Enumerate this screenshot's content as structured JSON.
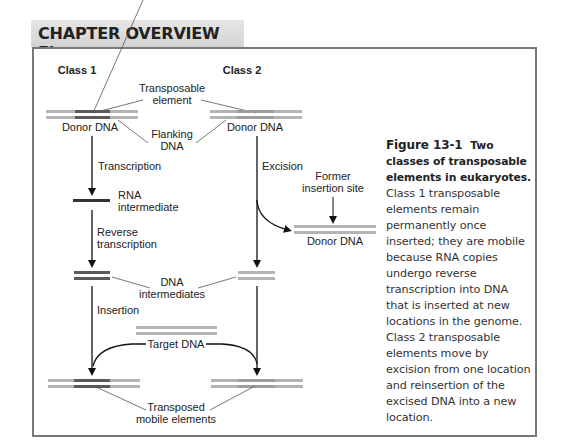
{
  "header": {
    "title": "CHAPTER OVERVIEW Figure"
  },
  "diagram": {
    "class1_label": "Class 1",
    "class2_label": "Class 2",
    "transposable_element": [
      "Transposable",
      "element"
    ],
    "donor_dna_left": "Donor DNA",
    "donor_dna_right": "Donor DNA",
    "flanking_dna": [
      "Flanking",
      "DNA"
    ],
    "transcription": "Transcription",
    "excision": "Excision",
    "former_insertion_site": [
      "Former",
      "insertion site"
    ],
    "donor_dna_excised": "Donor DNA",
    "rna_intermediate": [
      "RNA",
      "intermediate"
    ],
    "reverse_transcription": [
      "Reverse",
      "transcription"
    ],
    "dna_intermediates": [
      "DNA",
      "intermediates"
    ],
    "insertion": "Insertion",
    "target_dna": "Target DNA",
    "transposed_mobile_elements": [
      "Transposed",
      "mobile elements"
    ],
    "colors": {
      "light_strand": "#b3b3b3",
      "dark_segment": "#5a5a5a",
      "rna": "#333333",
      "arrow": "#111111"
    }
  },
  "caption": {
    "figure_number": "Figure 13-1",
    "title": "Two classes of transposable elements in eukaryotes.",
    "body": "Class 1 transposable elements remain permanently once inserted; they are mobile because RNA copies undergo reverse transcription into DNA that is inserted at new locations in the genome. Class 2 transposable elements move by excision from one location and reinsertion of the excised DNA into a new location."
  }
}
